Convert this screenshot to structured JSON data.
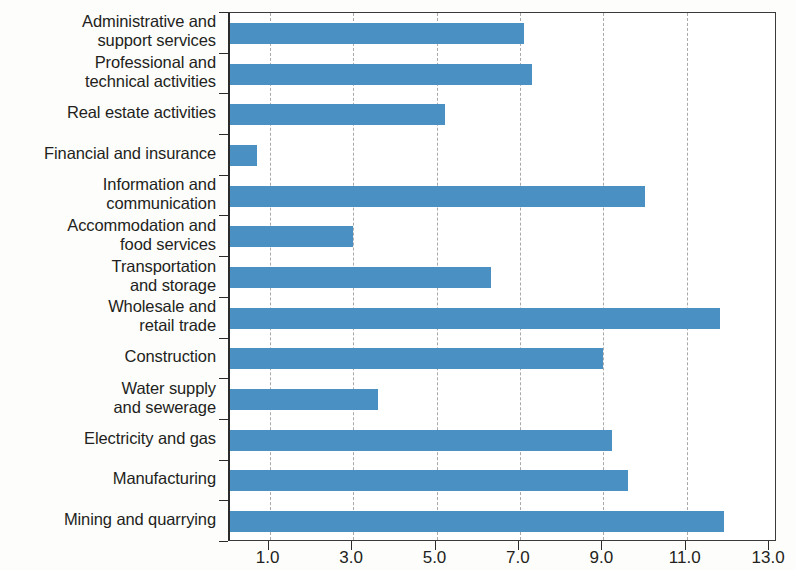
{
  "chart_data": {
    "type": "bar",
    "orientation": "horizontal",
    "title": "",
    "subtitle": "",
    "xlabel": "",
    "ylabel": "",
    "xlim": [
      0,
      13.1
    ],
    "xticks": [
      "1.0",
      "3.0",
      "5.0",
      "7.0",
      "9.0",
      "11.0",
      "13.0"
    ],
    "xtick_values": [
      1.0,
      3.0,
      5.0,
      7.0,
      9.0,
      11.0,
      13.0
    ],
    "gridlines": [
      1.0,
      3.0,
      5.0,
      7.0,
      9.0,
      11.0
    ],
    "grid": true,
    "legend": null,
    "bar_color": "#4a90c2",
    "categories": [
      "Administrative and\nsupport services",
      "Professional and\ntechnical activities",
      "Real estate activities",
      "Financial and insurance",
      "Information and\ncommunication",
      "Accommodation and\nfood services",
      "Transportation\nand storage",
      "Wholesale and\nretail trade",
      "Construction",
      "Water supply\nand sewerage",
      "Electricity and gas",
      "Manufacturing",
      "Mining and quarrying"
    ],
    "values": [
      7.1,
      7.3,
      5.2,
      0.7,
      10.0,
      3.0,
      6.3,
      11.8,
      9.0,
      3.6,
      9.2,
      9.6,
      11.9
    ]
  }
}
